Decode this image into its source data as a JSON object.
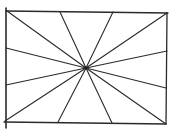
{
  "diagram": {
    "type": "radial-lines-in-rectangle",
    "stroke_color": "#2a2a2a",
    "background": "#ffffff",
    "frame": {
      "edges": [
        {
          "name": "top",
          "x1": 6,
          "y1": 11,
          "x2": 168,
          "y2": 13
        },
        {
          "name": "right",
          "x1": 167,
          "y1": 13,
          "x2": 166,
          "y2": 124
        },
        {
          "name": "bottom",
          "x1": 4,
          "y1": 122,
          "x2": 166,
          "y2": 124
        },
        {
          "name": "left",
          "x1": 6,
          "y1": 8,
          "x2": 6,
          "y2": 128
        }
      ]
    },
    "center": {
      "x": 86,
      "y": 68
    },
    "rays": [
      {
        "x": 7,
        "y": 11
      },
      {
        "x": 60,
        "y": 12
      },
      {
        "x": 113,
        "y": 12
      },
      {
        "x": 167,
        "y": 13
      },
      {
        "x": 167,
        "y": 51
      },
      {
        "x": 166,
        "y": 88
      },
      {
        "x": 166,
        "y": 124
      },
      {
        "x": 112,
        "y": 123
      },
      {
        "x": 58,
        "y": 122
      },
      {
        "x": 5,
        "y": 121
      },
      {
        "x": 6,
        "y": 85
      },
      {
        "x": 6,
        "y": 48
      }
    ]
  }
}
